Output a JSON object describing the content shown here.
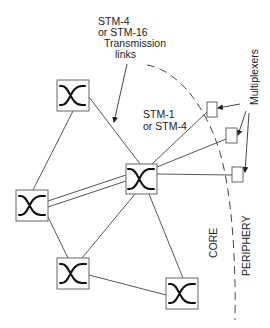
{
  "diagram": {
    "labels": {
      "trunk_line1": "STM-4",
      "trunk_line2": "or STM-16",
      "trunk_line3": "Transmission",
      "trunk_line4": "links",
      "access_line1": "STM-1",
      "access_line2": "or STM-4",
      "multiplexers": "Multiplexers",
      "core": "CORE",
      "periphery": "PERIPHERY"
    },
    "nodes": [
      {
        "id": "switch-top",
        "type": "cross-connect switch"
      },
      {
        "id": "switch-center",
        "type": "cross-connect switch"
      },
      {
        "id": "switch-left",
        "type": "cross-connect switch"
      },
      {
        "id": "switch-bottom-left",
        "type": "cross-connect switch"
      },
      {
        "id": "switch-bottom-right",
        "type": "cross-connect switch"
      },
      {
        "id": "mux-1",
        "type": "multiplexer"
      },
      {
        "id": "mux-2",
        "type": "multiplexer"
      },
      {
        "id": "mux-3",
        "type": "multiplexer"
      }
    ],
    "edges": [
      {
        "from": "switch-top",
        "to": "switch-left"
      },
      {
        "from": "switch-top",
        "to": "switch-center"
      },
      {
        "from": "switch-left",
        "to": "switch-center",
        "style": "double"
      },
      {
        "from": "switch-left",
        "to": "switch-bottom-left"
      },
      {
        "from": "switch-center",
        "to": "switch-bottom-left"
      },
      {
        "from": "switch-center",
        "to": "switch-bottom-right"
      },
      {
        "from": "switch-bottom-left",
        "to": "switch-bottom-right"
      },
      {
        "from": "switch-center",
        "to": "mux-1"
      },
      {
        "from": "switch-center",
        "to": "mux-2"
      },
      {
        "from": "switch-center",
        "to": "mux-3"
      }
    ],
    "regions": [
      "CORE",
      "PERIPHERY"
    ]
  }
}
